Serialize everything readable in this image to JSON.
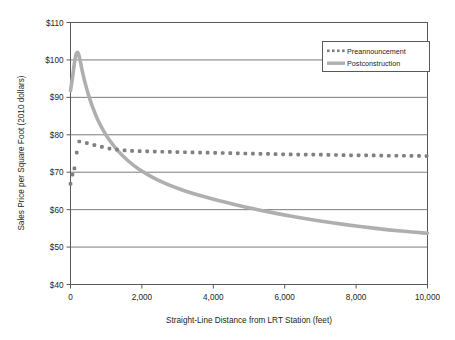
{
  "chart_data": {
    "type": "line",
    "title": "",
    "xlabel": "Straight-Line Distance from LRT Station (feet)",
    "ylabel": "Sales Price per Square Foot (2010 dollars)",
    "xlim": [
      0,
      10000
    ],
    "ylim": [
      40,
      110
    ],
    "xticks": [
      0,
      2000,
      4000,
      6000,
      8000,
      10000
    ],
    "xtick_labels": [
      "0",
      "2,000",
      "4,000",
      "6,000",
      "8,000",
      "10,000"
    ],
    "yticks": [
      40,
      50,
      60,
      70,
      80,
      90,
      100,
      110
    ],
    "ytick_labels": [
      "$40",
      "$50",
      "$60",
      "$70",
      "$80",
      "$90",
      "$100",
      "$110"
    ],
    "grid": "horizontal",
    "legend_position": "top-right",
    "colors": {
      "preannouncement": "#808080",
      "postconstruction": "#afafaf",
      "axis": "#595959",
      "gridline": "#6d6d6d",
      "text": "#231f20"
    },
    "series": [
      {
        "name": "Preannouncement",
        "style": "dotted",
        "color": "#808080",
        "x": [
          0,
          60,
          120,
          180,
          250,
          330,
          420,
          520,
          640,
          780,
          950,
          1150,
          1400,
          1700,
          2050,
          2450,
          2900,
          3400,
          3900,
          4400,
          4900,
          5400,
          5900,
          6400,
          6900,
          7400,
          7900,
          8400,
          8900,
          9400,
          10000
        ],
        "y": [
          66.9,
          69.6,
          71.3,
          75.6,
          78.4,
          78.2,
          77.9,
          77.6,
          77.3,
          77.0,
          76.6,
          76.2,
          75.9,
          75.7,
          75.6,
          75.5,
          75.4,
          75.3,
          75.2,
          75.1,
          75.0,
          74.9,
          74.8,
          74.7,
          74.7,
          74.6,
          74.5,
          74.5,
          74.4,
          74.4,
          74.3
        ]
      },
      {
        "name": "Postconstruction",
        "style": "solid",
        "color": "#afafaf",
        "x": [
          0,
          60,
          110,
          160,
          210,
          260,
          320,
          400,
          500,
          620,
          760,
          930,
          1120,
          1350,
          1620,
          1930,
          2300,
          2700,
          3150,
          3650,
          4200,
          4800,
          5450,
          6150,
          6900,
          7700,
          8550,
          9250,
          10000
        ],
        "y": [
          91.8,
          95.5,
          99.2,
          101.6,
          101.9,
          100.3,
          97.5,
          94.2,
          90.8,
          87.4,
          84.1,
          81.0,
          78.2,
          75.5,
          73.0,
          70.7,
          68.6,
          66.8,
          65.2,
          63.7,
          62.3,
          60.9,
          59.6,
          58.3,
          57.1,
          56.0,
          55.0,
          54.3,
          53.7
        ]
      }
    ],
    "legend": [
      {
        "label": "Preannouncement",
        "marker": "dotted"
      },
      {
        "label": "Postconstruction",
        "marker": "solid"
      }
    ]
  }
}
